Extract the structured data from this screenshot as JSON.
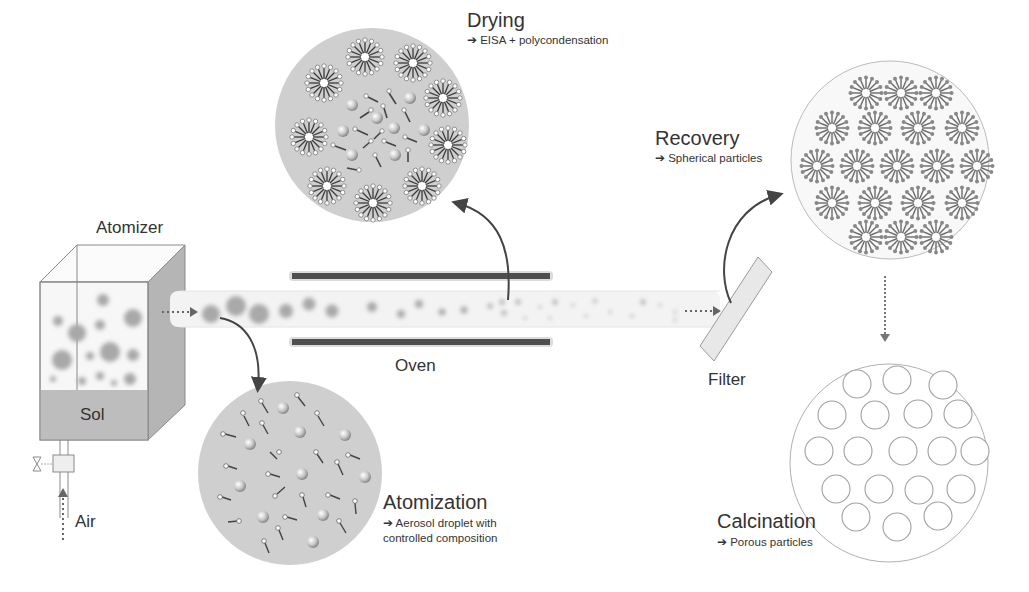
{
  "diagram": {
    "colors": {
      "background": "#ffffff",
      "text": "#333333",
      "particle_disk": "#cfcfcf",
      "droplet": "#a9a9a9",
      "oven_bar": "#555555",
      "tube": "#f2f2f2",
      "arrow": "#444444",
      "outline": "#9a9a9a"
    },
    "components": {
      "atomizer": "Atomizer",
      "sol": "Sol",
      "air": "Air",
      "oven": "Oven",
      "filter": "Filter"
    },
    "stages": [
      {
        "id": "drying",
        "title": "Drying",
        "arrow": "➔",
        "desc": "EISA + polycondensation"
      },
      {
        "id": "recovery",
        "title": "Recovery",
        "arrow": "➔",
        "desc": "Spherical particles"
      },
      {
        "id": "atomization",
        "title": "Atomization",
        "arrow": "➔",
        "desc_line1": "Aerosol droplet with",
        "desc_line2": "controlled composition"
      },
      {
        "id": "calcination",
        "title": "Calcination",
        "arrow": "➔",
        "desc": "Porous particles"
      }
    ]
  }
}
